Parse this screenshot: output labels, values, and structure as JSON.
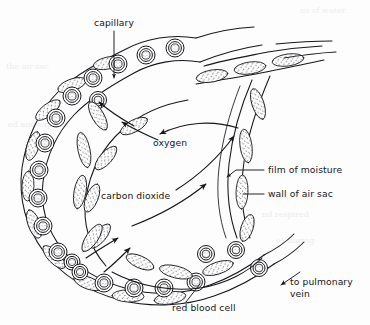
{
  "figure": {
    "type": "biological-diagram",
    "background_color": "#fdfdfd",
    "ink_color": "#16171b",
    "labels": [
      {
        "id": "capillary",
        "text": "capillary",
        "x": 114,
        "y": 26,
        "anchor": "middle",
        "leader": "vertical line down to vessel wall, small arrowhead at end"
      },
      {
        "id": "oxygen",
        "text": "oxygen",
        "x": 153,
        "y": 142,
        "anchor": "start",
        "leader": "none; arrows above point left into capillary"
      },
      {
        "id": "carbon-dioxide",
        "text": "carbon dioxide",
        "x": 101,
        "y": 196,
        "anchor": "start",
        "leader": "none; curved arrows point up-right into air sac"
      },
      {
        "id": "film-of-moisture",
        "text": "film of moisture",
        "x": 268,
        "y": 173,
        "anchor": "start",
        "leader": "horizontal line left to arrowhead on inner wall"
      },
      {
        "id": "wall-of-air-sac",
        "text": "wall of air sac",
        "x": 268,
        "y": 197,
        "anchor": "start",
        "leader": "horizontal line left to stippled wall cell"
      },
      {
        "id": "red-blood-cell",
        "text": "red blood cell",
        "x": 172,
        "y": 311,
        "anchor": "start",
        "leader": "diagonal line up-left to a red blood cell"
      },
      {
        "id": "to-pulmonary-vein-line1",
        "text": "to pulmonary",
        "x": 290,
        "y": 285,
        "anchor": "start",
        "leader": "diagonal arrow down-left toward vessel"
      },
      {
        "id": "to-pulmonary-vein-line2",
        "text": "vein",
        "x": 290,
        "y": 297,
        "anchor": "start",
        "leader": "none"
      }
    ],
    "structures": {
      "capillary": "A broad U-shaped (horseshoe) vessel sweeping from upper right, around the left side, and back to lower right",
      "red_blood_cells": "Chain of circular biconcave cells drawn as concentric rings with stippled centres, following the capillary lumen",
      "air_sac_wall": "Stippled elongated lens-shaped wall cells lining the capillary and the inner air sac boundary",
      "film_of_moisture": "Thin line just inside the air sac wall on the right",
      "gas_flow": "Arrows showing oxygen moving into the capillary and carbon dioxide moving out into the air sac"
    },
    "red_blood_cell_count_visible": 26
  },
  "page_bleed": {
    "note": "faint show-through text from the reverse of the scanned page",
    "lines": [
      "ns of water",
      "the air sac",
      "nd respired",
      "es during",
      "ed and expired"
    ]
  }
}
